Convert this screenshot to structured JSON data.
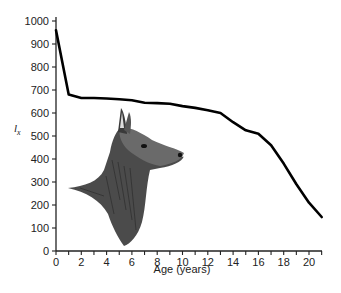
{
  "chart_data": {
    "type": "line",
    "title": "",
    "xlabel": "Age (years)",
    "ylabel": "l_x",
    "ylabel_display": "l",
    "ylabel_sub": "x",
    "xlim": [
      0,
      21
    ],
    "ylim": [
      0,
      1000
    ],
    "grid": false,
    "legend": null,
    "x_ticks": [
      0,
      1,
      2,
      3,
      4,
      5,
      6,
      7,
      8,
      9,
      10,
      11,
      12,
      13,
      14,
      15,
      16,
      17,
      18,
      19,
      20,
      21
    ],
    "x_tick_labels": [
      "0",
      "2",
      "4",
      "6",
      "8",
      "10",
      "12",
      "14",
      "16",
      "18",
      "20"
    ],
    "y_ticks": [
      0,
      100,
      200,
      300,
      400,
      500,
      600,
      700,
      800,
      900,
      1000
    ],
    "y_tick_labels": [
      "0",
      "100",
      "200",
      "300",
      "400",
      "500",
      "600",
      "700",
      "800",
      "900",
      "1000"
    ],
    "series": [
      {
        "name": "survivorship",
        "color": "#000000",
        "x": [
          0,
          1,
          2,
          3,
          4,
          5,
          6,
          7,
          8,
          9,
          10,
          11,
          12,
          13,
          14,
          15,
          16,
          17,
          18,
          19,
          20,
          21
        ],
        "values": [
          960,
          680,
          665,
          665,
          663,
          660,
          655,
          645,
          643,
          640,
          630,
          622,
          612,
          600,
          560,
          525,
          510,
          460,
          380,
          290,
          210,
          148
        ]
      }
    ],
    "annotations": [
      "illustration: drawing of a deer/elk head (doe) inside plot area"
    ]
  }
}
